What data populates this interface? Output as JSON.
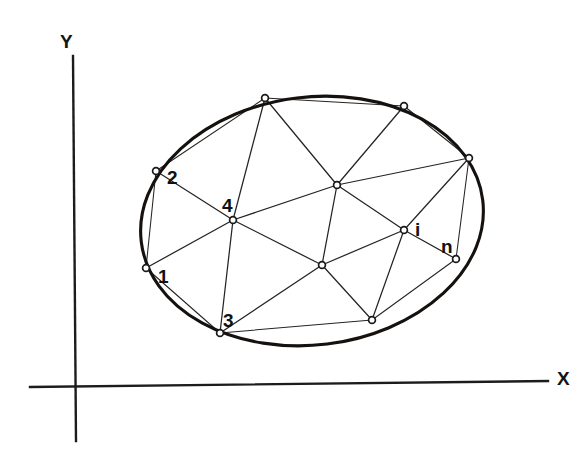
{
  "figure": {
    "kind": "finite-element-mesh-diagram",
    "background_color": "#ffffff",
    "ink_color": "#1a1a1a"
  },
  "axes": {
    "x_axis": {
      "label": "X",
      "label_x": 557,
      "label_y": 385,
      "x1": 30,
      "y1": 387,
      "x2": 548,
      "y2": 381
    },
    "y_axis": {
      "label": "Y",
      "label_x": 60,
      "label_y": 48,
      "x1": 73,
      "y1": 56,
      "x2": 76,
      "y2": 441
    }
  },
  "boundary": {
    "name": "elliptical-domain-boundary",
    "center_x": 312,
    "center_y": 221,
    "radius_x": 172,
    "radius_y": 124,
    "rotation_deg": -7,
    "stroke_width": 3.1
  },
  "nodes": [
    {
      "id": "n1",
      "label": "1",
      "x": 146,
      "y": 268,
      "label_x": 158,
      "label_y": 283,
      "boundary": true
    },
    {
      "id": "n2",
      "label": "2",
      "x": 156,
      "y": 171,
      "label_x": 167,
      "label_y": 184,
      "boundary": true
    },
    {
      "id": "n3",
      "label": "3",
      "x": 220,
      "y": 333,
      "label_x": 223,
      "label_y": 327,
      "boundary": true
    },
    {
      "id": "n4",
      "label": "4",
      "x": 233,
      "y": 220,
      "label_x": 222,
      "label_y": 212,
      "boundary": false
    },
    {
      "id": "ni",
      "label": "i",
      "x": 404,
      "y": 230,
      "label_x": 415,
      "label_y": 236,
      "boundary": false
    },
    {
      "id": "nn",
      "label": "n",
      "x": 456,
      "y": 259,
      "label_x": 441,
      "label_y": 253,
      "boundary": true
    },
    {
      "id": "nt1",
      "label": "",
      "x": 265,
      "y": 98,
      "label_x": 0,
      "label_y": 0,
      "boundary": true
    },
    {
      "id": "nt2",
      "label": "",
      "x": 404,
      "y": 106,
      "label_x": 0,
      "label_y": 0,
      "boundary": true
    },
    {
      "id": "nr1",
      "label": "",
      "x": 469,
      "y": 158,
      "label_x": 0,
      "label_y": 0,
      "boundary": true
    },
    {
      "id": "nc1",
      "label": "",
      "x": 337,
      "y": 185,
      "label_x": 0,
      "label_y": 0,
      "boundary": false
    },
    {
      "id": "nc2",
      "label": "",
      "x": 322,
      "y": 265,
      "label_x": 0,
      "label_y": 0,
      "boundary": false
    },
    {
      "id": "nb1",
      "label": "",
      "x": 372,
      "y": 320,
      "label_x": 0,
      "label_y": 0,
      "boundary": true
    }
  ],
  "edges": [
    {
      "from": "n1",
      "to": "n2",
      "kind": "chord"
    },
    {
      "from": "n1",
      "to": "n3",
      "kind": "chord"
    },
    {
      "from": "n1",
      "to": "n4",
      "kind": "mesh"
    },
    {
      "from": "n2",
      "to": "n4",
      "kind": "mesh"
    },
    {
      "from": "n2",
      "to": "nt1",
      "kind": "chord"
    },
    {
      "from": "n3",
      "to": "n4",
      "kind": "mesh"
    },
    {
      "from": "n3",
      "to": "nc2",
      "kind": "mesh"
    },
    {
      "from": "n3",
      "to": "nb1",
      "kind": "chord"
    },
    {
      "from": "n4",
      "to": "nt1",
      "kind": "mesh"
    },
    {
      "from": "n4",
      "to": "nc1",
      "kind": "mesh"
    },
    {
      "from": "n4",
      "to": "nc2",
      "kind": "mesh"
    },
    {
      "from": "nt1",
      "to": "nt2",
      "kind": "chord"
    },
    {
      "from": "nt1",
      "to": "nc1",
      "kind": "mesh"
    },
    {
      "from": "nt2",
      "to": "nc1",
      "kind": "mesh"
    },
    {
      "from": "nt2",
      "to": "nr1",
      "kind": "chord"
    },
    {
      "from": "nc1",
      "to": "nr1",
      "kind": "mesh"
    },
    {
      "from": "nc1",
      "to": "nc2",
      "kind": "mesh"
    },
    {
      "from": "nc1",
      "to": "ni",
      "kind": "mesh"
    },
    {
      "from": "nc2",
      "to": "ni",
      "kind": "mesh"
    },
    {
      "from": "nc2",
      "to": "nb1",
      "kind": "mesh"
    },
    {
      "from": "ni",
      "to": "nr1",
      "kind": "mesh"
    },
    {
      "from": "ni",
      "to": "nn",
      "kind": "mesh"
    },
    {
      "from": "ni",
      "to": "nb1",
      "kind": "mesh"
    },
    {
      "from": "nn",
      "to": "nr1",
      "kind": "chord"
    },
    {
      "from": "nn",
      "to": "nb1",
      "kind": "chord"
    }
  ],
  "node_marker": {
    "radius": 3.4,
    "fill": "#ffffff",
    "stroke": "#1a1a1a"
  }
}
